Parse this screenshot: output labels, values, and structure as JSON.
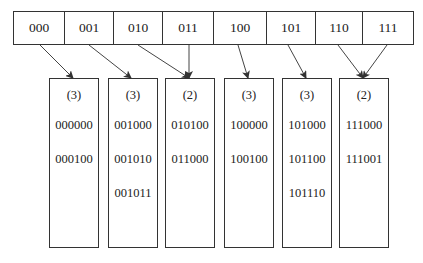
{
  "directory": {
    "cells": [
      {
        "label": "000",
        "width": 51
      },
      {
        "label": "001",
        "width": 49
      },
      {
        "label": "010",
        "width": 49
      },
      {
        "label": "011",
        "width": 51
      },
      {
        "label": "100",
        "width": 53
      },
      {
        "label": "101",
        "width": 49
      },
      {
        "label": "110",
        "width": 47
      },
      {
        "label": "111",
        "width": 50
      }
    ]
  },
  "buckets": [
    {
      "depth": "(3)",
      "keys": [
        "000000",
        "000100"
      ],
      "left": 49
    },
    {
      "depth": "(3)",
      "keys": [
        "001000",
        "001010",
        "001011"
      ],
      "left": 108
    },
    {
      "depth": "(2)",
      "keys": [
        "010100",
        "011000"
      ],
      "left": 165
    },
    {
      "depth": "(3)",
      "keys": [
        "100000",
        "100100"
      ],
      "left": 224
    },
    {
      "depth": "(3)",
      "keys": [
        "101000",
        "101100",
        "101110"
      ],
      "left": 282
    },
    {
      "depth": "(2)",
      "keys": [
        "111000",
        "111001"
      ],
      "left": 339
    }
  ],
  "pointers": [
    {
      "from": "000",
      "to_bucket": 0,
      "x1": 40,
      "x2": 73
    },
    {
      "from": "001",
      "to_bucket": 1,
      "x1": 89,
      "x2": 131
    },
    {
      "from": "010",
      "to_bucket": 2,
      "x1": 138,
      "x2": 189
    },
    {
      "from": "011",
      "to_bucket": 2,
      "x1": 189,
      "x2": 189
    },
    {
      "from": "100",
      "to_bucket": 3,
      "x1": 238,
      "x2": 248
    },
    {
      "from": "101",
      "to_bucket": 4,
      "x1": 288,
      "x2": 306
    },
    {
      "from": "110",
      "to_bucket": 5,
      "x1": 338,
      "x2": 363
    },
    {
      "from": "111",
      "to_bucket": 5,
      "x1": 387,
      "x2": 363
    }
  ]
}
